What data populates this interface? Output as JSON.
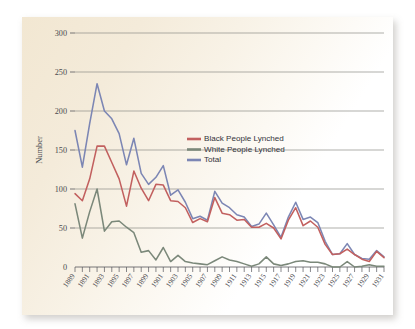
{
  "chart_data": {
    "type": "line",
    "title": "",
    "xlabel": "",
    "ylabel": "Number",
    "ylim": [
      0,
      300
    ],
    "ytick_step": 50,
    "yticks": [
      0,
      50,
      100,
      150,
      200,
      250,
      300
    ],
    "ytick_labels": [
      "0",
      "50",
      "100",
      "150",
      "200",
      "250",
      "300"
    ],
    "grid": true,
    "grid_axis": "y",
    "legend_position": "upper-center-right",
    "x": [
      1889,
      1890,
      1891,
      1892,
      1893,
      1894,
      1895,
      1896,
      1897,
      1898,
      1899,
      1900,
      1901,
      1902,
      1903,
      1904,
      1905,
      1906,
      1907,
      1908,
      1909,
      1910,
      1911,
      1912,
      1913,
      1914,
      1915,
      1916,
      1917,
      1918,
      1919,
      1920,
      1921,
      1922,
      1923,
      1924,
      1925,
      1926,
      1927,
      1928,
      1929,
      1930,
      1931
    ],
    "xtick_labels": [
      "1889",
      "1891",
      "1893",
      "1895",
      "1897",
      "1899",
      "1901",
      "1903",
      "1905",
      "1907",
      "1909",
      "1911",
      "1913",
      "1915",
      "1917",
      "1919",
      "1921",
      "1923",
      "1925",
      "1927",
      "1929",
      "1931"
    ],
    "xtick_label_step": 2,
    "xlim": [
      1889,
      1931
    ],
    "series": [
      {
        "name": "Black People Lynched",
        "color": "#c2605f",
        "values": [
          94,
          85,
          113,
          155,
          155,
          134,
          113,
          78,
          123,
          101,
          85,
          106,
          105,
          85,
          84,
          76,
          57,
          62,
          58,
          89,
          69,
          67,
          60,
          61,
          51,
          51,
          56,
          50,
          36,
          60,
          76,
          53,
          59,
          51,
          29,
          16,
          17,
          23,
          16,
          10,
          7,
          20,
          12
        ]
      },
      {
        "name": "White People Lynched",
        "color": "#7b887a",
        "values": [
          81,
          37,
          71,
          100,
          46,
          58,
          59,
          51,
          44,
          19,
          21,
          9,
          25,
          7,
          15,
          7,
          5,
          4,
          3,
          8,
          13,
          9,
          7,
          4,
          1,
          4,
          13,
          4,
          2,
          4,
          7,
          8,
          6,
          6,
          4,
          0,
          0,
          7,
          0,
          1,
          3,
          1,
          1
        ]
      },
      {
        "name": "Total",
        "color": "#7c86b4",
        "values": [
          175,
          128,
          184,
          235,
          200,
          190,
          171,
          131,
          165,
          120,
          106,
          115,
          130,
          92,
          99,
          83,
          62,
          65,
          60,
          97,
          82,
          76,
          67,
          64,
          52,
          55,
          69,
          54,
          38,
          64,
          83,
          61,
          64,
          57,
          33,
          16,
          17,
          30,
          16,
          11,
          10,
          21,
          13
        ]
      }
    ]
  }
}
